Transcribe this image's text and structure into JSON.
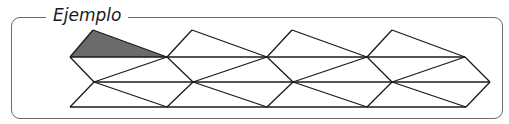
{
  "title": "Ejemplo",
  "colors": {
    "stroke": "#1a1a1a",
    "shade": "#6b6b6b",
    "frame": "#6a6a6a"
  },
  "shaded_triangle": [
    [
      70,
      57
    ],
    [
      93,
      30
    ],
    [
      167,
      57
    ]
  ],
  "lines": [
    [
      [
        70,
        57
      ],
      [
        465,
        57
      ]
    ],
    [
      [
        94,
        82
      ],
      [
        490,
        82
      ]
    ],
    [
      [
        70,
        107
      ],
      [
        466,
        107
      ]
    ],
    [
      [
        70,
        57
      ],
      [
        93,
        30
      ]
    ],
    [
      [
        93,
        30
      ],
      [
        167,
        57
      ]
    ],
    [
      [
        167,
        57
      ],
      [
        192,
        30
      ]
    ],
    [
      [
        192,
        30
      ],
      [
        267,
        57
      ]
    ],
    [
      [
        267,
        57
      ],
      [
        292,
        30
      ]
    ],
    [
      [
        292,
        30
      ],
      [
        367,
        57
      ]
    ],
    [
      [
        367,
        57
      ],
      [
        392,
        30
      ]
    ],
    [
      [
        392,
        30
      ],
      [
        465,
        57
      ]
    ],
    [
      [
        70,
        57
      ],
      [
        94,
        82
      ]
    ],
    [
      [
        94,
        82
      ],
      [
        167,
        57
      ]
    ],
    [
      [
        167,
        57
      ],
      [
        193,
        82
      ]
    ],
    [
      [
        193,
        82
      ],
      [
        267,
        57
      ]
    ],
    [
      [
        267,
        57
      ],
      [
        293,
        82
      ]
    ],
    [
      [
        293,
        82
      ],
      [
        367,
        57
      ]
    ],
    [
      [
        367,
        57
      ],
      [
        392,
        82
      ]
    ],
    [
      [
        392,
        82
      ],
      [
        465,
        57
      ]
    ],
    [
      [
        465,
        57
      ],
      [
        490,
        82
      ]
    ],
    [
      [
        70,
        107
      ],
      [
        94,
        82
      ]
    ],
    [
      [
        94,
        82
      ],
      [
        167,
        107
      ]
    ],
    [
      [
        167,
        107
      ],
      [
        193,
        82
      ]
    ],
    [
      [
        193,
        82
      ],
      [
        267,
        107
      ]
    ],
    [
      [
        267,
        107
      ],
      [
        293,
        82
      ]
    ],
    [
      [
        293,
        82
      ],
      [
        367,
        107
      ]
    ],
    [
      [
        367,
        107
      ],
      [
        392,
        82
      ]
    ],
    [
      [
        392,
        82
      ],
      [
        466,
        107
      ]
    ],
    [
      [
        466,
        107
      ],
      [
        490,
        82
      ]
    ]
  ]
}
